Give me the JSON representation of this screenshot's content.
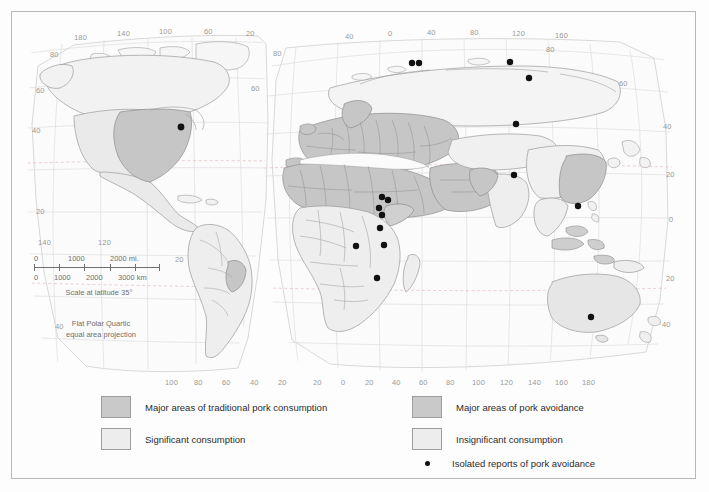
{
  "map": {
    "title": "World map of pork consumption and avoidance",
    "projection_note_line1": "Flat Polar Quartic",
    "projection_note_line2": "equal area projection",
    "scale": {
      "miles_labels": [
        "0",
        "1000",
        "2000 mi."
      ],
      "km_labels": [
        "0",
        "1000",
        "2000",
        "3000 km"
      ],
      "caption": "Scale at latitude 35°"
    },
    "colors": {
      "major_consumption": "#c9c9c9",
      "significant_consumption": "#ededed",
      "major_avoidance": "#c9c9c9",
      "insignificant_consumption": "#ededed",
      "isolated_report_dot": "#111111",
      "ocean": "#fbfbfb",
      "graticule": "#d9d9d9",
      "coastline": "#9a9a9a",
      "border_frame": "#b9b9b9",
      "label_text": "#9a9a9a"
    },
    "left_panel": {
      "top_longitude_labels": [
        "180",
        "140",
        "100",
        "60",
        "20"
      ],
      "bottom_longitude_labels": [
        "100",
        "80",
        "60",
        "40",
        "20"
      ],
      "inner_longitude_labels": [
        "140",
        "120"
      ],
      "left_latitude_labels": [
        "80",
        "60",
        "40",
        "20",
        "40"
      ],
      "right_latitude_labels": [
        "80",
        "60",
        "20"
      ]
    },
    "right_panel": {
      "top_longitude_labels": [
        "40",
        "0",
        "40",
        "80",
        "120",
        "160"
      ],
      "bottom_longitude_labels": [
        "20",
        "0",
        "20",
        "40",
        "60",
        "80",
        "100",
        "120",
        "140",
        "160",
        "180"
      ],
      "right_latitude_labels": [
        "80",
        "60",
        "40",
        "20",
        "0",
        "20",
        "40"
      ]
    }
  },
  "legend": {
    "items": [
      {
        "label": "Major areas of traditional pork consumption",
        "swatch": "dark"
      },
      {
        "label": "Major areas of pork avoidance",
        "swatch": "dark"
      },
      {
        "label": "Significant consumption",
        "swatch": "light"
      },
      {
        "label": "Insignificant consumption",
        "swatch": "light"
      },
      {
        "label": "Isolated reports of pork avoidance",
        "swatch": "dot"
      }
    ]
  }
}
